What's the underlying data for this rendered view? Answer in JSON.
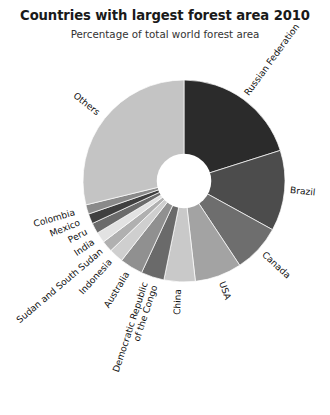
{
  "chart_title": "Countries with largest forest area 2010",
  "chart_subtitle": "Percentage of total world forest area",
  "chart_data": {
    "type": "pie",
    "title": "Countries with largest forest area 2010",
    "subtitle": "Percentage of total world forest area",
    "xlabel": "",
    "ylabel": "Percentage of total world forest area",
    "units": "percent",
    "donut": true,
    "inner_radius_ratio": 0.27,
    "start_angle_deg": 0,
    "direction": "clockwise",
    "legend": "none",
    "grid": false,
    "labels_placement": "outside-rotated",
    "categories": [
      "Russian Federation",
      "Brazil",
      "Canada",
      "USA",
      "China",
      "Democratic Republic of the Congo",
      "Australia",
      "Indonesia",
      "Sudan and South Sudan",
      "India",
      "Peru",
      "Mexico",
      "Colombia",
      "Others"
    ],
    "values": [
      20.1,
      12.9,
      7.7,
      7.5,
      5.0,
      3.7,
      3.7,
      2.3,
      1.8,
      1.7,
      1.7,
      1.6,
      1.5,
      28.8
    ],
    "slices": [
      {
        "label": "Russian Federation",
        "value": 20.1,
        "color": "#2b2b2b"
      },
      {
        "label": "Brazil",
        "value": 12.9,
        "color": "#4c4c4c"
      },
      {
        "label": "Canada",
        "value": 7.7,
        "color": "#6e6e6e"
      },
      {
        "label": "USA",
        "value": 7.5,
        "color": "#a3a3a3"
      },
      {
        "label": "China",
        "value": 5.0,
        "color": "#c9c9c9"
      },
      {
        "label": "Democratic Republic of the Congo",
        "value": 3.7,
        "color": "#6a6a6a"
      },
      {
        "label": "Australia",
        "value": 3.7,
        "color": "#909090"
      },
      {
        "label": "Indonesia",
        "value": 2.3,
        "color": "#cfcfcf"
      },
      {
        "label": "Sudan and South Sudan",
        "value": 1.8,
        "color": "#b0b0b0"
      },
      {
        "label": "India",
        "value": 1.7,
        "color": "#e2e2e2"
      },
      {
        "label": "Peru",
        "value": 1.7,
        "color": "#6b6b6b"
      },
      {
        "label": "Mexico",
        "value": 1.6,
        "color": "#3f3f3f"
      },
      {
        "label": "Colombia",
        "value": 1.5,
        "color": "#8a8a8a"
      },
      {
        "label": "Others",
        "value": 28.8,
        "color": "#c4c4c4"
      }
    ],
    "colors": {
      "background": "#ffffff",
      "text": "#111111",
      "title": "#1a1a1a",
      "hole": "#ffffff"
    }
  },
  "labels": {
    "russian_federation": "Russian Federation",
    "brazil": "Brazil",
    "canada": "Canada",
    "usa": "USA",
    "china": "China",
    "drc_line1": "Democratic Republic",
    "drc_line2": "of the Congo",
    "australia": "Australia",
    "indonesia": "Indonesia",
    "sudan": "Sudan and South Sudan",
    "india": "India",
    "peru": "Peru",
    "mexico": "Mexico",
    "colombia": "Colombia",
    "others": "Others"
  }
}
